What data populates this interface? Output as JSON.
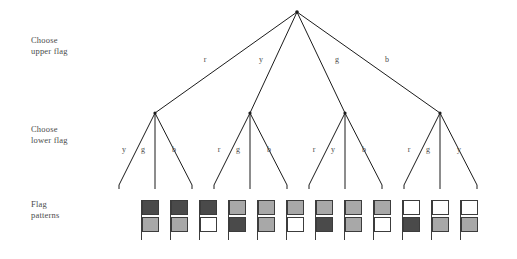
{
  "diagram": {
    "row_labels": {
      "upper": "Choose\nupper flag",
      "lower": "Choose\nlower flag",
      "flags": "Flag\npatterns"
    },
    "colors": {
      "r": "#4a4a4a",
      "y": "#a8a8a8",
      "g": "#a8a8a8",
      "b": "#ffffff",
      "line": "#1b1b1b",
      "text": "#4b4b4b",
      "background": "#ffffff",
      "flag_outline": "#3c3c3c"
    },
    "root": {
      "x": 297,
      "y": 12
    },
    "level1": {
      "label_key": "upper",
      "branches": [
        {
          "code": "r",
          "x": 155,
          "y": 113
        },
        {
          "code": "y",
          "x": 250,
          "y": 113
        },
        {
          "code": "g",
          "x": 345,
          "y": 113
        },
        {
          "code": "b",
          "x": 440,
          "y": 113
        }
      ],
      "edge_labels": [
        {
          "text": "r",
          "x": 205,
          "y": 62
        },
        {
          "text": "y",
          "x": 261,
          "y": 62
        },
        {
          "text": "g",
          "x": 337,
          "y": 62
        },
        {
          "text": "b",
          "x": 387,
          "y": 62
        }
      ]
    },
    "level2": {
      "label_key": "lower",
      "groups": [
        {
          "parent": "r",
          "children": [
            {
              "code": "y",
              "x": 119,
              "y": 185,
              "edge_label_x": 124,
              "edge_label_y": 152
            },
            {
              "code": "g",
              "x": 155,
              "y": 185,
              "edge_label_x": 143,
              "edge_label_y": 152
            },
            {
              "code": "b",
              "x": 192,
              "y": 185,
              "edge_label_x": 174,
              "edge_label_y": 152
            }
          ]
        },
        {
          "parent": "y",
          "children": [
            {
              "code": "r",
              "x": 214,
              "y": 185,
              "edge_label_x": 219,
              "edge_label_y": 152
            },
            {
              "code": "g",
              "x": 250,
              "y": 185,
              "edge_label_x": 238,
              "edge_label_y": 152
            },
            {
              "code": "b",
              "x": 287,
              "y": 185,
              "edge_label_x": 269,
              "edge_label_y": 152
            }
          ]
        },
        {
          "parent": "g",
          "children": [
            {
              "code": "r",
              "x": 309,
              "y": 185,
              "edge_label_x": 314,
              "edge_label_y": 152
            },
            {
              "code": "y",
              "x": 345,
              "y": 185,
              "edge_label_x": 333,
              "edge_label_y": 152
            },
            {
              "code": "b",
              "x": 382,
              "y": 185,
              "edge_label_x": 364,
              "edge_label_y": 152
            }
          ]
        },
        {
          "parent": "b",
          "children": [
            {
              "code": "r",
              "x": 404,
              "y": 185,
              "edge_label_x": 409,
              "edge_label_y": 152
            },
            {
              "code": "g",
              "x": 440,
              "y": 185,
              "edge_label_x": 428,
              "edge_label_y": 152
            },
            {
              "code": "y",
              "x": 477,
              "y": 185,
              "edge_label_x": 459,
              "edge_label_y": 152
            }
          ]
        }
      ]
    },
    "level3": {
      "label_key": "flags",
      "flag_top": 200,
      "flags": [
        {
          "index": 1,
          "upper": "r",
          "lower": "y",
          "x": 141
        },
        {
          "index": 2,
          "upper": "r",
          "lower": "g",
          "x": 170
        },
        {
          "index": 3,
          "upper": "r",
          "lower": "b",
          "x": 199
        },
        {
          "index": 4,
          "upper": "y",
          "lower": "r",
          "x": 228
        },
        {
          "index": 5,
          "upper": "y",
          "lower": "g",
          "x": 257
        },
        {
          "index": 6,
          "upper": "y",
          "lower": "b",
          "x": 286
        },
        {
          "index": 7,
          "upper": "g",
          "lower": "r",
          "x": 315
        },
        {
          "index": 8,
          "upper": "g",
          "lower": "y",
          "x": 344
        },
        {
          "index": 9,
          "upper": "g",
          "lower": "b",
          "x": 373
        },
        {
          "index": 10,
          "upper": "b",
          "lower": "r",
          "x": 402
        },
        {
          "index": 11,
          "upper": "b",
          "lower": "g",
          "x": 431
        },
        {
          "index": 12,
          "upper": "b",
          "lower": "y",
          "x": 460
        }
      ]
    }
  }
}
